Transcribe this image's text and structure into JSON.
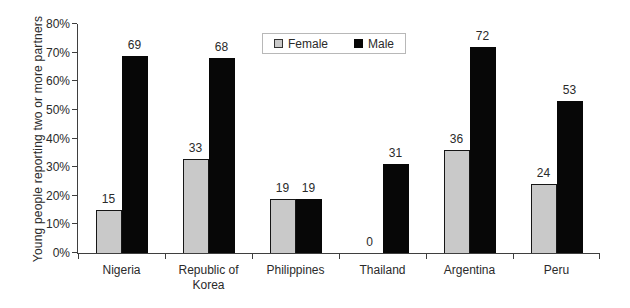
{
  "chart_data": {
    "type": "bar",
    "title": "",
    "xlabel": "",
    "ylabel": "Young people reporting two or more partners",
    "ylim": [
      0,
      80
    ],
    "yticks": [
      0,
      10,
      20,
      30,
      40,
      50,
      60,
      70,
      80
    ],
    "ytick_suffix": "%",
    "grid": false,
    "legend_position": "top-inside-left-of-center",
    "categories": [
      "Nigeria",
      "Republic of Korea",
      "Philippines",
      "Thailand",
      "Argentina",
      "Peru"
    ],
    "series": [
      {
        "name": "Female",
        "color": "#c9c9c9",
        "border_color": "#161616",
        "values": [
          15,
          33,
          19,
          0,
          36,
          24
        ]
      },
      {
        "name": "Male",
        "color": "#070707",
        "border_color": "#070707",
        "values": [
          69,
          68,
          19,
          31,
          72,
          53
        ]
      }
    ],
    "value_labels_shown": true
  },
  "colors": {
    "background": "#ffffff",
    "axis": "#3f3f3f",
    "text": "#2a2a2a",
    "legend_border": "#b8b8b8"
  }
}
